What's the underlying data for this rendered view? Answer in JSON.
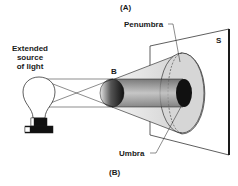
{
  "diagram": {
    "top_label": "(A)",
    "bottom_label": "(B)",
    "source_label_lines": [
      "Extended",
      "source",
      "of light"
    ],
    "object_label": "B",
    "screen_label": "S",
    "penumbra_label": "Penumbra",
    "umbra_label": "Umbra"
  },
  "colors": {
    "line": "#1a1a1a",
    "penumbra_fill": "#d9d9d9",
    "umbra_fill": "#111111",
    "background": "#ffffff"
  }
}
